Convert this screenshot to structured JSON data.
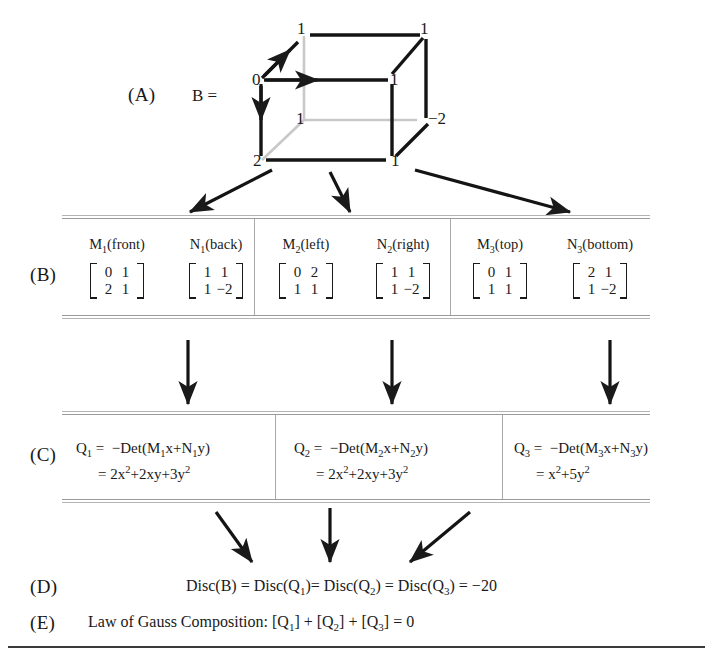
{
  "labels": {
    "a": "(A)",
    "b": "(B)",
    "c": "(C)",
    "d": "(D)",
    "e": "(E)"
  },
  "cube": {
    "equation": "B =",
    "vertex_values": {
      "top_back_left": "1",
      "top_back_right": "1",
      "top_front_left": "0",
      "top_front_right": "1",
      "bottom_back_left": "1",
      "bottom_back_right": "−2",
      "bottom_front_left": "2",
      "bottom_front_right": "1"
    },
    "arrow_labels": {
      "x_axis": "x",
      "y_axis": "y",
      "z_axis": "z"
    }
  },
  "table_b": {
    "headers": [
      "M₁(front)",
      "N₁(back)",
      "M₂(left)",
      "N₂(right)",
      "M₃(top)",
      "N₃(bottom)"
    ],
    "header_parts": [
      {
        "base": "M",
        "sub": "1",
        "rest": "(front)"
      },
      {
        "base": "N",
        "sub": "1",
        "rest": "(back)"
      },
      {
        "base": "M",
        "sub": "2",
        "rest": "(left)"
      },
      {
        "base": "N",
        "sub": "2",
        "rest": "(right)"
      },
      {
        "base": "M",
        "sub": "3",
        "rest": "(top)"
      },
      {
        "base": "N",
        "sub": "3",
        "rest": "(bottom)"
      }
    ],
    "matrices": [
      {
        "name": "M1",
        "rows": [
          [
            "0",
            "1"
          ],
          [
            "2",
            "1"
          ]
        ]
      },
      {
        "name": "N1",
        "rows": [
          [
            "1",
            "1"
          ],
          [
            "1",
            "−2"
          ]
        ]
      },
      {
        "name": "M2",
        "rows": [
          [
            "0",
            "2"
          ],
          [
            "1",
            "1"
          ]
        ]
      },
      {
        "name": "N2",
        "rows": [
          [
            "1",
            "1"
          ],
          [
            "1",
            "−2"
          ]
        ]
      },
      {
        "name": "M3",
        "rows": [
          [
            "0",
            "1"
          ],
          [
            "1",
            "1"
          ]
        ]
      },
      {
        "name": "N3",
        "rows": [
          [
            "2",
            "1"
          ],
          [
            "1",
            "−2"
          ]
        ]
      }
    ]
  },
  "table_c": {
    "forms": [
      {
        "name": "Q",
        "index": "1",
        "det_expr": "= −Det(M₁x+N₁y)",
        "det_parts": {
          "lead": "= −Det(M",
          "sub1": "1",
          "mid": "x+N",
          "sub2": "1",
          "tail": "y)"
        },
        "value_expr": "= 2x²+2xy+3y²",
        "value_parts": [
          {
            "t": "= 2x",
            "sup": "2"
          },
          {
            "t": "+2xy+3y",
            "sup": "2"
          }
        ]
      },
      {
        "name": "Q",
        "index": "2",
        "det_expr": "= −Det(M₂x+N₂y)",
        "det_parts": {
          "lead": "= −Det(M",
          "sub1": "2",
          "mid": "x+N",
          "sub2": "2",
          "tail": "y)"
        },
        "value_expr": "= 2x²+2xy+3y²",
        "value_parts": [
          {
            "t": "= 2x",
            "sup": "2"
          },
          {
            "t": "+2xy+3y",
            "sup": "2"
          }
        ]
      },
      {
        "name": "Q",
        "index": "3",
        "det_expr": "= −Det(M₃x+N₃y)",
        "det_parts": {
          "lead": "= −Det(M",
          "sub1": "3",
          "mid": "x+N",
          "sub2": "3",
          "tail": "y)"
        },
        "value_expr": "= x²+5y²",
        "value_parts": [
          {
            "t": "= x",
            "sup": "2"
          },
          {
            "t": "+5y",
            "sup": "2"
          }
        ]
      }
    ]
  },
  "row_d": {
    "text": "Disc(B) = Disc(Q₁)= Disc(Q₂) =  Disc(Q₃) = −20",
    "parts": {
      "p1": "Disc(B) = Disc(Q",
      "s1": "1",
      "p2": ")= Disc(Q",
      "s2": "2",
      "p3": ") =  Disc(Q",
      "s3": "3",
      "p4": ") = −20"
    }
  },
  "row_e": {
    "text": "Law of Gauss Composition: [Q₁] + [Q₂] + [Q₃] = 0",
    "parts": {
      "p1": "Law of Gauss Composition: [Q",
      "s1": "1",
      "p2": "] + [Q",
      "s2": "2",
      "p3": "] + [Q",
      "s3": "3",
      "p4": "] = 0"
    }
  },
  "colors": {
    "ink": "#1a1a1a",
    "rule": "#9a9a9a",
    "hidden_edge": "#c9c9c9",
    "bottom_rule": "#3a3a3a"
  }
}
